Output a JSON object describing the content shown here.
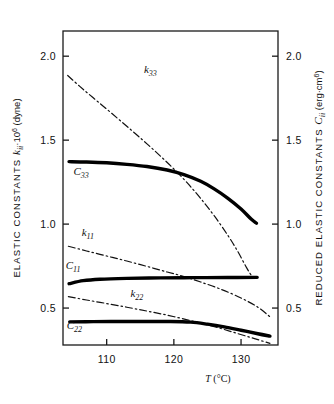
{
  "chart_data": {
    "type": "line",
    "title": "",
    "xlabel": "T (°C)",
    "ylabel_left": "ELASTIC CONSTANTS kᵢᵢ·10⁶ (dyne)",
    "ylabel_right": "REDUCED ELASTIC CONSTANTS Cᵢᵢ (erg·cm⁶)",
    "xlim": [
      103.5,
      135.5
    ],
    "ylim": [
      0.28,
      2.15
    ],
    "grid": false,
    "legend_position": "inline-labels",
    "xticks": [
      110,
      120,
      130
    ],
    "xtick_labels": [
      "110",
      "120",
      "130"
    ],
    "yticks": [
      0.5,
      1.0,
      1.5,
      2.0
    ],
    "ytick_labels_left": [
      "0.5",
      "1.0",
      "1.5",
      "2.0"
    ],
    "ytick_labels_right": [
      "0.5",
      "1.0",
      "1.5",
      "2.0"
    ],
    "series": [
      {
        "name": "k33",
        "label": "k",
        "subscript": "33",
        "style": "dash-dot",
        "linewidth": 1.2,
        "color": "#111111",
        "label_x": 116.5,
        "label_y": 1.9,
        "points": [
          [
            104.2,
            1.885
          ],
          [
            106.0,
            1.82
          ],
          [
            108.0,
            1.752
          ],
          [
            110.0,
            1.685
          ],
          [
            112.0,
            1.617
          ],
          [
            114.0,
            1.548
          ],
          [
            116.0,
            1.478
          ],
          [
            118.0,
            1.405
          ],
          [
            120.0,
            1.328
          ],
          [
            122.0,
            1.245
          ],
          [
            124.0,
            1.152
          ],
          [
            126.0,
            1.05
          ],
          [
            128.0,
            0.935
          ],
          [
            129.5,
            0.838
          ],
          [
            130.8,
            0.742
          ],
          [
            131.6,
            0.69
          ]
        ]
      },
      {
        "name": "C33",
        "label": "C",
        "subscript": "33",
        "style": "solid-thick",
        "linewidth": 3.4,
        "color": "#000000",
        "label_x": 106.2,
        "label_y": 1.295,
        "points": [
          [
            104.4,
            1.372
          ],
          [
            107.0,
            1.37
          ],
          [
            110.0,
            1.365
          ],
          [
            113.0,
            1.356
          ],
          [
            116.0,
            1.343
          ],
          [
            119.0,
            1.322
          ],
          [
            121.5,
            1.295
          ],
          [
            124.0,
            1.255
          ],
          [
            126.0,
            1.21
          ],
          [
            128.0,
            1.155
          ],
          [
            130.0,
            1.09
          ],
          [
            131.5,
            1.03
          ],
          [
            132.3,
            1.005
          ]
        ]
      },
      {
        "name": "k11",
        "label": "k",
        "subscript": "11",
        "style": "dash-dot",
        "linewidth": 1.2,
        "color": "#111111",
        "label_x": 107.2,
        "label_y": 0.93,
        "points": [
          [
            104.3,
            0.868
          ],
          [
            107.0,
            0.84
          ],
          [
            110.0,
            0.81
          ],
          [
            113.0,
            0.78
          ],
          [
            116.0,
            0.748
          ],
          [
            119.0,
            0.715
          ],
          [
            121.5,
            0.688
          ],
          [
            124.0,
            0.655
          ],
          [
            127.0,
            0.612
          ],
          [
            130.0,
            0.56
          ],
          [
            132.5,
            0.505
          ],
          [
            134.3,
            0.448
          ]
        ]
      },
      {
        "name": "C11",
        "label": "C",
        "subscript": "11",
        "style": "solid-thick",
        "linewidth": 3.4,
        "color": "#000000",
        "label_x": 105.0,
        "label_y": 0.735,
        "points": [
          [
            104.4,
            0.645
          ],
          [
            106.5,
            0.663
          ],
          [
            109.0,
            0.672
          ],
          [
            113.0,
            0.677
          ],
          [
            118.0,
            0.68
          ],
          [
            123.0,
            0.681
          ],
          [
            128.0,
            0.682
          ],
          [
            132.4,
            0.683
          ]
        ]
      },
      {
        "name": "k22",
        "label": "k",
        "subscript": "22",
        "style": "dash-dot",
        "linewidth": 1.2,
        "color": "#111111",
        "label_x": 114.5,
        "label_y": 0.565,
        "points": [
          [
            104.3,
            0.568
          ],
          [
            107.0,
            0.548
          ],
          [
            110.0,
            0.527
          ],
          [
            113.0,
            0.505
          ],
          [
            116.0,
            0.482
          ],
          [
            119.0,
            0.458
          ],
          [
            122.0,
            0.43
          ],
          [
            124.5,
            0.405
          ],
          [
            127.0,
            0.378
          ],
          [
            129.5,
            0.348
          ],
          [
            132.0,
            0.318
          ],
          [
            134.3,
            0.29
          ]
        ]
      },
      {
        "name": "C22",
        "label": "C",
        "subscript": "22",
        "style": "solid-thick",
        "linewidth": 3.4,
        "color": "#000000",
        "label_x": 105.2,
        "label_y": 0.375,
        "points": [
          [
            104.5,
            0.418
          ],
          [
            108.0,
            0.419
          ],
          [
            112.0,
            0.42
          ],
          [
            116.0,
            0.42
          ],
          [
            119.5,
            0.42
          ],
          [
            122.5,
            0.416
          ],
          [
            125.0,
            0.404
          ],
          [
            127.5,
            0.388
          ],
          [
            130.0,
            0.368
          ],
          [
            132.5,
            0.347
          ],
          [
            134.3,
            0.333
          ]
        ]
      }
    ]
  },
  "axes": {
    "left_title_parts": {
      "main": "ELASTIC CONSTANTS",
      "symbol": "k",
      "symbol_sub": "ii",
      "factor": "·10",
      "exponent": "6",
      "unit": "(dyne)"
    },
    "right_title_parts": {
      "main": "REDUCED ELASTIC CONSTANTS",
      "symbol": "C",
      "symbol_sub": "ii",
      "unit_open": "(erg·cm",
      "exponent": "6",
      "unit_close": ")"
    },
    "x_title_symbol": "T",
    "x_title_unit": "(°C)"
  },
  "colors": {
    "frame": "#1a1a1a",
    "text": "#111111",
    "thick_curve": "#000000",
    "dash_curve": "#111111",
    "background": "#ffffff"
  }
}
